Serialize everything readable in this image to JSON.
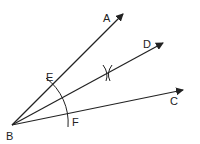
{
  "diagram": {
    "points": {
      "A": {
        "label": "A",
        "x": 106,
        "y": 13
      },
      "D": {
        "label": "D",
        "x": 143,
        "y": 39
      },
      "C": {
        "label": "C",
        "x": 170,
        "y": 96
      },
      "E": {
        "label": "E",
        "x": 46,
        "y": 72
      },
      "F": {
        "label": "F",
        "x": 72,
        "y": 117
      },
      "B": {
        "label": "B",
        "x": 6,
        "y": 131
      }
    },
    "rays": [
      "BA",
      "BD",
      "BC"
    ],
    "arc": "EF centered at B",
    "stroke_color": "#222222"
  }
}
